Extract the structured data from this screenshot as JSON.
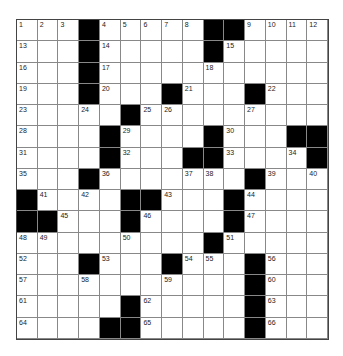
{
  "puzzle": {
    "rows": 15,
    "cols": 15,
    "grid": [
      [
        "1",
        "2",
        "3",
        "#",
        "4",
        "5",
        "6",
        "7",
        "8",
        "#",
        "#",
        "9",
        "10",
        "11",
        "12"
      ],
      [
        "13",
        ".",
        ".",
        "#",
        "14",
        ".",
        ".",
        ".",
        ".",
        "#",
        "15",
        ".",
        ".",
        ".",
        "."
      ],
      [
        "16",
        ".",
        ".",
        "#",
        "17",
        ".",
        ".",
        ".",
        ".",
        "18",
        ".",
        ".",
        ".",
        ".",
        "."
      ],
      [
        "19",
        ".",
        ".",
        "#",
        "20",
        ".",
        ".",
        "#",
        "21",
        ".",
        ".",
        "#",
        "22",
        ".",
        "."
      ],
      [
        "23",
        ".",
        ".",
        "24",
        ".",
        "#",
        "25",
        "26",
        ".",
        ".",
        ".",
        "27",
        ".",
        ".",
        "."
      ],
      [
        "28",
        ".",
        ".",
        ".",
        "#",
        "29",
        ".",
        ".",
        ".",
        "#",
        "30",
        ".",
        ".",
        "#",
        "#"
      ],
      [
        "31",
        ".",
        ".",
        ".",
        "#",
        "32",
        ".",
        ".",
        "#",
        "#",
        "33",
        ".",
        ".",
        "34",
        "#"
      ],
      [
        "35",
        ".",
        ".",
        "#",
        "36",
        ".",
        ".",
        ".",
        "37",
        "38",
        ".",
        "#",
        "39",
        ".",
        "40"
      ],
      [
        "#",
        "41",
        ".",
        "42",
        ".",
        "#",
        "#",
        "43",
        ".",
        ".",
        "#",
        "44",
        ".",
        ".",
        "."
      ],
      [
        "#",
        "#",
        "45",
        ".",
        ".",
        "#",
        "46",
        ".",
        ".",
        ".",
        "#",
        "47",
        ".",
        ".",
        "."
      ],
      [
        "48",
        "49",
        ".",
        ".",
        ".",
        "50",
        ".",
        ".",
        ".",
        "#",
        "51",
        ".",
        ".",
        ".",
        "."
      ],
      [
        "52",
        ".",
        ".",
        "#",
        "53",
        ".",
        ".",
        "#",
        "54",
        "55",
        ".",
        "#",
        "56",
        ".",
        "."
      ],
      [
        "57",
        ".",
        ".",
        "58",
        ".",
        ".",
        ".",
        "59",
        ".",
        ".",
        ".",
        "#",
        "60",
        ".",
        "."
      ],
      [
        "61",
        ".",
        ".",
        ".",
        ".",
        "#",
        "62",
        ".",
        ".",
        ".",
        ".",
        "#",
        "63",
        ".",
        "."
      ],
      [
        "64",
        ".",
        ".",
        ".",
        "#",
        "#",
        "65",
        ".",
        ".",
        ".",
        ".",
        "#",
        "66",
        ".",
        "."
      ]
    ]
  }
}
